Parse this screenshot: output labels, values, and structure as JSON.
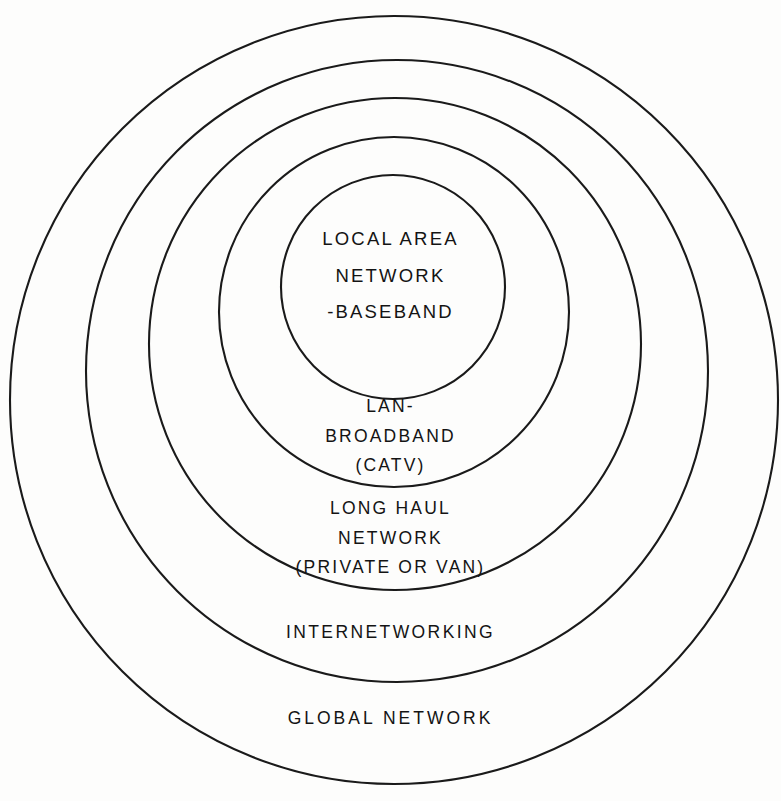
{
  "diagram": {
    "type": "concentric-rings",
    "background_color": "#fdfdfc",
    "stroke_color": "#1a1a1a",
    "text_color": "#141414",
    "rings": [
      {
        "id": "global-network",
        "order": 5,
        "scope": "outermost",
        "lines": [
          "GLOBAL NETWORK"
        ],
        "cx": 394,
        "cy": 400,
        "r": 384
      },
      {
        "id": "internetworking",
        "order": 4,
        "scope": "fourth",
        "lines": [
          "INTERNETWORKING"
        ],
        "cx": 397,
        "cy": 371,
        "r": 311
      },
      {
        "id": "long-haul-network",
        "order": 3,
        "scope": "third",
        "lines": [
          "LONG HAUL",
          "NETWORK",
          "(PRIVATE OR VAN)"
        ],
        "cx": 395,
        "cy": 344,
        "r": 246
      },
      {
        "id": "lan-broadband",
        "order": 2,
        "scope": "second",
        "lines": [
          "LAN-",
          "BROADBAND",
          "(CATV)"
        ],
        "cx": 394,
        "cy": 312,
        "r": 175
      },
      {
        "id": "lan-baseband",
        "order": 1,
        "scope": "innermost",
        "lines": [
          "LOCAL AREA",
          "NETWORK",
          "-BASEBAND"
        ],
        "cx": 393,
        "cy": 287,
        "r": 112
      }
    ]
  },
  "labels": {
    "lan_baseband": {
      "line1": "LOCAL AREA",
      "line2": "NETWORK",
      "line3": "-BASEBAND"
    },
    "lan_broadband": {
      "line1": "LAN-",
      "line2": "BROADBAND",
      "line3": "(CATV)"
    },
    "long_haul": {
      "line1": "LONG HAUL",
      "line2": "NETWORK",
      "line3": "(PRIVATE OR VAN)"
    },
    "internetworking": {
      "line1": "INTERNETWORKING"
    },
    "global_network": {
      "line1": "GLOBAL NETWORK"
    }
  }
}
